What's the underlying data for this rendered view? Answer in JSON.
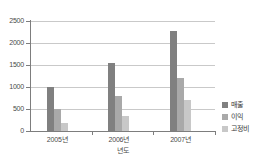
{
  "chart_data": {
    "type": "bar",
    "title": "",
    "xlabel": "년도",
    "ylabel": "",
    "categories": [
      "2005년",
      "2006년",
      "2007년"
    ],
    "ylim": [
      0,
      2500
    ],
    "yticks": [
      0,
      500,
      1000,
      1500,
      2000,
      2500
    ],
    "ytick_labels": [
      "0",
      "500",
      "1000",
      "1500",
      "2000",
      "2500"
    ],
    "grid": true,
    "legend_position": "right",
    "series": [
      {
        "name": "매출",
        "values": [
          1000,
          1550,
          2280
        ],
        "color": "#808080"
      },
      {
        "name": "이익",
        "values": [
          500,
          800,
          1200
        ],
        "color": "#a9a9a9"
      },
      {
        "name": "고정비",
        "values": [
          180,
          350,
          700
        ],
        "color": "#c8c8c8"
      }
    ]
  },
  "axis": {
    "x_title": "년도"
  },
  "legend": {
    "items": [
      {
        "label": "매출",
        "color": "#808080"
      },
      {
        "label": "이익",
        "color": "#a9a9a9"
      },
      {
        "label": "고정비",
        "color": "#c8c8c8"
      }
    ]
  }
}
